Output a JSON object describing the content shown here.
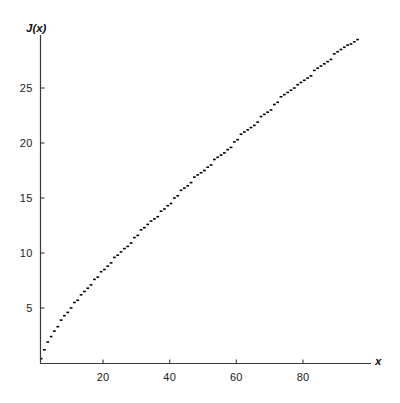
{
  "chart_data": {
    "type": "line",
    "title": "",
    "subtitle": "",
    "xlabel": "x",
    "ylabel": "J(x)",
    "grid": false,
    "legend": null,
    "step_style": "post",
    "xlim": [
      0,
      100
    ],
    "ylim": [
      0,
      29
    ],
    "xticks": [
      20,
      40,
      60,
      80
    ],
    "xtick_labels": [
      "20",
      "40",
      "60",
      "80"
    ],
    "yticks": [
      5,
      10,
      15,
      20,
      25
    ],
    "ytick_labels": [
      "5",
      "10",
      "15",
      "20",
      "25"
    ],
    "series": [
      {
        "name": "J(x)",
        "color": "#000000",
        "x": [
          1,
          2,
          3,
          4,
          5,
          6,
          7,
          8,
          9,
          10,
          11,
          12,
          13,
          14,
          15,
          16,
          17,
          18,
          19,
          20,
          21,
          22,
          23,
          24,
          25,
          26,
          27,
          28,
          29,
          30,
          31,
          32,
          33,
          34,
          35,
          36,
          37,
          38,
          39,
          40,
          41,
          42,
          43,
          44,
          45,
          46,
          47,
          48,
          49,
          50,
          51,
          52,
          53,
          54,
          55,
          56,
          57,
          58,
          59,
          60,
          61,
          62,
          63,
          64,
          65,
          66,
          67,
          68,
          69,
          70,
          71,
          72,
          73,
          74,
          75,
          76,
          77,
          78,
          79,
          80,
          81,
          82,
          83,
          84,
          85,
          86,
          87,
          88,
          89,
          90,
          91,
          92,
          93,
          94,
          95,
          96,
          97,
          98,
          99,
          100
        ],
        "y": [
          0.4,
          1.2,
          1.9,
          2.4,
          2.9,
          3.3,
          3.9,
          4.3,
          4.6,
          5.0,
          5.5,
          5.7,
          6.2,
          6.5,
          6.8,
          7.1,
          7.6,
          7.8,
          8.3,
          8.5,
          8.8,
          9.1,
          9.6,
          9.8,
          10.1,
          10.4,
          10.6,
          10.9,
          11.4,
          11.6,
          12.1,
          12.3,
          12.6,
          12.9,
          13.1,
          13.3,
          13.8,
          14.0,
          14.3,
          14.5,
          15.0,
          15.2,
          15.7,
          15.9,
          16.1,
          16.4,
          16.9,
          17.1,
          17.3,
          17.5,
          17.8,
          18.0,
          18.5,
          18.7,
          18.9,
          19.1,
          19.4,
          19.6,
          20.1,
          20.3,
          20.8,
          21.0,
          21.2,
          21.4,
          21.6,
          21.9,
          22.4,
          22.6,
          22.8,
          23.0,
          23.5,
          23.7,
          24.2,
          24.4,
          24.6,
          24.8,
          25.0,
          25.3,
          25.5,
          25.7,
          25.9,
          26.1,
          26.6,
          26.8,
          27.0,
          27.2,
          27.4,
          27.6,
          28.1,
          28.3,
          28.5,
          28.7,
          28.9,
          29.0,
          29.2,
          29.4,
          29.6,
          29.8,
          30.0,
          30.2
        ]
      }
    ]
  },
  "axes": {
    "y_title": "J(x)",
    "x_title": "x"
  }
}
